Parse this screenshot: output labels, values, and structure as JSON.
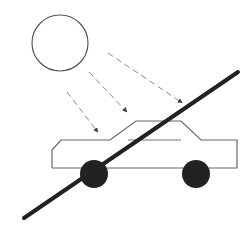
{
  "diagram": {
    "colors": {
      "background": "#ffffff",
      "outline": "#555555",
      "rays": "#8a8a8a",
      "wheels": "#222222",
      "strike": "#222222"
    },
    "sun": {
      "cx": 60,
      "cy": 43,
      "r": 28
    },
    "rays": [
      {
        "x1": 67,
        "y1": 92,
        "x2": 97,
        "y2": 131
      },
      {
        "x1": 89,
        "y1": 72,
        "x2": 126,
        "y2": 111
      },
      {
        "x1": 108,
        "y1": 53,
        "x2": 181,
        "y2": 102
      }
    ],
    "car": {
      "body_points": "52,168 52,150 61,140 110,140 136,121 181,121 201,140 237,140 237,168 52,168",
      "window_line": {
        "x1": 128,
        "y1": 140,
        "x2": 181,
        "y2": 140
      },
      "wheels": [
        {
          "cx": 94,
          "cy": 174,
          "r": 14
        },
        {
          "cx": 196,
          "cy": 174,
          "r": 14
        }
      ]
    },
    "strike": {
      "x1": 24,
      "y1": 218,
      "x2": 238,
      "y2": 72,
      "width": 4
    }
  }
}
